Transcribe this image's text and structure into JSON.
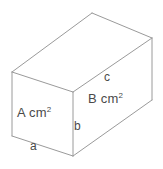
{
  "figure": {
    "type": "cuboid-net-diagram",
    "shape_name": "rectangular prism",
    "stroke_color": "#9a9a9a",
    "text_color": "#4a4a4a",
    "background_color": "#ffffff",
    "width_px": 163,
    "height_px": 169
  },
  "labels": {
    "face_front_left": {
      "text": "A cm",
      "exponent": "2",
      "full": "A cm2",
      "meaning": "area of front-left face"
    },
    "face_right": {
      "text": "B cm",
      "exponent": "2",
      "full": "B cm2",
      "meaning": "area of right face"
    },
    "edge_a": {
      "text": "a",
      "meaning": "width of front-left face / bottom edge"
    },
    "edge_b": {
      "text": "b",
      "meaning": "height of vertical front edge"
    },
    "edge_c": {
      "text": "c",
      "meaning": "length of top-right edge"
    }
  },
  "geometry": {
    "vertices": {
      "top_back_left": [
        12,
        72
      ],
      "top_back_center": [
        92,
        13
      ],
      "top_back_right": [
        152,
        38
      ],
      "front_top_center": [
        73,
        92
      ],
      "bottom_front_left": [
        12,
        136
      ],
      "bottom_front_center": [
        73,
        156
      ],
      "bottom_right": [
        152,
        100
      ]
    },
    "faces": {
      "top": "12,72 92,13 152,38 73,92",
      "front_left": "12,72 73,92 73,156 12,136",
      "right": "73,92 152,38 152,100 73,156"
    },
    "edges": [
      "12,72 92,13",
      "92,13 152,38",
      "152,38 73,92",
      "73,92 12,72",
      "12,72 12,136",
      "12,136 73,156",
      "73,92 73,156",
      "73,156 152,100",
      "152,38 152,100"
    ]
  }
}
